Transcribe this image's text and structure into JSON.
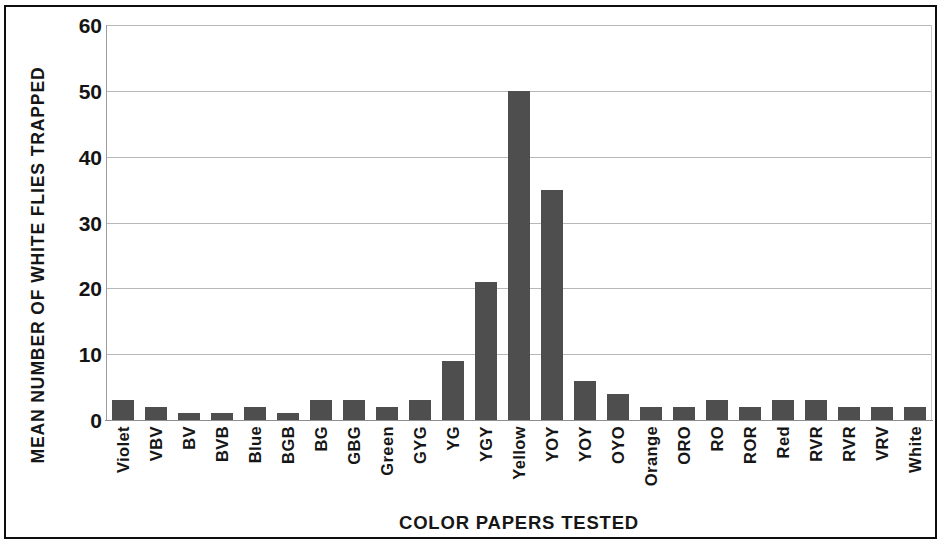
{
  "chart_data": {
    "type": "bar",
    "title": "",
    "xlabel": "COLOR PAPERS TESTED",
    "ylabel": "MEAN NUMBER OF WHITE FLIES TRAPPED",
    "ylim": [
      0,
      60
    ],
    "yticks": [
      0,
      10,
      20,
      30,
      40,
      50,
      60
    ],
    "ytick_labels": [
      "0",
      "10",
      "20",
      "30",
      "40",
      "50",
      "60"
    ],
    "grid": "horizontal",
    "legend": "none",
    "bar_color": "#4e4e4e",
    "categories": [
      "Violet",
      "VBV",
      "BV",
      "BVB",
      "Blue",
      "BGB",
      "BG",
      "GBG",
      "Green",
      "GYG",
      "YG",
      "YGY",
      "Yellow",
      "YOY",
      "YOY",
      "OYO",
      "Orange",
      "ORO",
      "RO",
      "ROR",
      "Red",
      "RVR",
      "RVR",
      "VRV",
      "White"
    ],
    "values": [
      3,
      2,
      1,
      1,
      2,
      1,
      3,
      3,
      2,
      3,
      9,
      21,
      50,
      35,
      6,
      4,
      2,
      2,
      3,
      2,
      3,
      3,
      2,
      2,
      2
    ]
  }
}
